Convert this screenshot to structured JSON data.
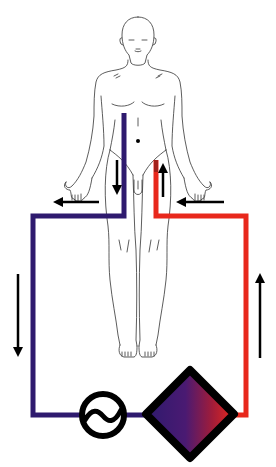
{
  "diagram": {
    "title": "Extracorporeal circuit (femoro-femoral ECMO)",
    "colors": {
      "venous": "#2e1a6e",
      "arterial": "#e8281c",
      "outline": "#333333",
      "arrow": "#000000",
      "component_stroke": "#000000"
    },
    "nodes": [
      {
        "id": "patient",
        "label": "Patient (human figure)"
      },
      {
        "id": "venous-cannula",
        "label": "Venous drainage cannula (right femoral)"
      },
      {
        "id": "arterial-cannula",
        "label": "Arterial return cannula (left femoral)"
      },
      {
        "id": "pump",
        "label": "Centrifugal pump"
      },
      {
        "id": "oxygenator",
        "label": "Oxygenator"
      }
    ],
    "edges": [
      {
        "from": "venous-cannula",
        "to": "pump",
        "color": "venous",
        "direction": "down-left"
      },
      {
        "from": "pump",
        "to": "oxygenator",
        "color": "venous"
      },
      {
        "from": "oxygenator",
        "to": "arterial-cannula",
        "color": "arterial",
        "direction": "up"
      }
    ],
    "arrows": [
      {
        "id": "arrow-venous-down-thigh",
        "direction": "down"
      },
      {
        "id": "arrow-arterial-up-thigh",
        "direction": "up"
      },
      {
        "id": "arrow-venous-left",
        "direction": "left"
      },
      {
        "id": "arrow-arterial-left",
        "direction": "left"
      },
      {
        "id": "arrow-venous-down-side",
        "direction": "down"
      },
      {
        "id": "arrow-arterial-up-side",
        "direction": "up"
      }
    ]
  }
}
